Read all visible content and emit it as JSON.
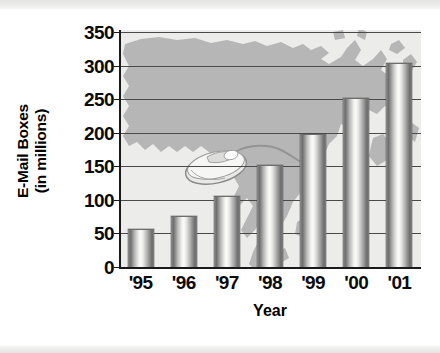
{
  "chart_data": {
    "type": "bar",
    "title": "",
    "xlabel": "Year",
    "ylabel": "E-Mail Boxes (in millions)",
    "ylabel_line1": "E-Mail Boxes",
    "ylabel_line2": "(in millions)",
    "categories": [
      "'95",
      "'96",
      "'97",
      "'98",
      "'99",
      "'00",
      "'01"
    ],
    "values": [
      55,
      75,
      105,
      150,
      197,
      250,
      303
    ],
    "series": [
      {
        "name": "E-Mail Boxes",
        "values": [
          55,
          75,
          105,
          150,
          197,
          250,
          303
        ]
      }
    ],
    "ylim": [
      0,
      350
    ],
    "ytick_labels": [
      "350",
      "300",
      "250",
      "200",
      "150",
      "100",
      "50",
      "0"
    ],
    "ytick_values": [
      350,
      300,
      250,
      200,
      150,
      100,
      50,
      0
    ],
    "grid": "horizontal",
    "legend": "none",
    "bar_color": "#b0b0b0",
    "gridline_color": "#4a4a4a",
    "axis_color": "#1a1a1a",
    "plot_background_color": "#ececeb",
    "map_color": "#b6b6b6",
    "annotations": [
      "North America map silhouette watermark",
      "computer mouse illustration with cable"
    ]
  },
  "decoration": {
    "map_name": "north-america-map-watermark",
    "mouse_name": "computer-mouse-illustration"
  }
}
